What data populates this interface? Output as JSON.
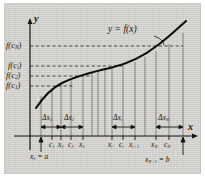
{
  "figure": {
    "type": "riemann-sum-diagram",
    "background_color": "#d2d0cc",
    "curve_color": "#101010",
    "grid_color": "#6b6b6b",
    "dash_color": "#3a3a3a"
  },
  "axes": {
    "y_label": "y",
    "x_label": "x",
    "origin": {
      "x": 30,
      "y": 136
    }
  },
  "curve_label": "y = f(x)",
  "y_values": [
    {
      "id": "fcN",
      "text_main": "f(c",
      "text_sub": "N",
      "text_end": ")",
      "y": 46
    },
    {
      "id": "fci",
      "text_main": "f(c",
      "text_sub": "i",
      "text_end": ")",
      "y": 66
    },
    {
      "id": "fc2",
      "text_main": "f(c",
      "text_sub": "2",
      "text_end": ")",
      "y": 76
    },
    {
      "id": "fc1",
      "text_main": "f(c",
      "text_sub": "1",
      "text_end": ")",
      "y": 86
    }
  ],
  "dashed_lines": [
    {
      "id": "fcN",
      "y": 46,
      "x_end": 183
    },
    {
      "id": "fci",
      "y": 66,
      "x_end": 125
    },
    {
      "id": "fc2",
      "y": 76,
      "x_end": 92
    },
    {
      "id": "fc1",
      "y": 86,
      "x_end": 74
    }
  ],
  "delta_labels": [
    {
      "id": "dx1",
      "text_main": "Δx",
      "text_sub": "1",
      "x": 50,
      "y": 118
    },
    {
      "id": "dx2",
      "text_main": "Δx",
      "text_sub": "2",
      "x": 77,
      "y": 118
    },
    {
      "id": "dxi",
      "text_main": "Δx",
      "text_sub": "i",
      "x": 119,
      "y": 118
    },
    {
      "id": "dxN",
      "text_main": "Δx",
      "text_sub": "N",
      "x": 163,
      "y": 118
    }
  ],
  "x_ticks": [
    {
      "id": "c1",
      "text_main": "c",
      "text_sub": "1",
      "x": 52
    },
    {
      "id": "x2",
      "text_main": "x",
      "text_sub": "2",
      "x": 62
    },
    {
      "id": "c2",
      "text_main": "c",
      "text_sub": "2",
      "x": 71
    },
    {
      "id": "x3",
      "text_main": "x",
      "text_sub": "3",
      "x": 83
    },
    {
      "id": "xi",
      "text_main": "x",
      "text_sub": "i",
      "x": 112
    },
    {
      "id": "ci",
      "text_main": "c",
      "text_sub": "i",
      "x": 123
    },
    {
      "id": "xi1",
      "text_main": "x",
      "text_sub": "i+1",
      "x": 135
    },
    {
      "id": "xN",
      "text_main": "x",
      "text_sub": "N",
      "x": 156
    },
    {
      "id": "cN",
      "text_main": "c",
      "text_sub": "N",
      "x": 169
    }
  ],
  "endpoints": [
    {
      "id": "a",
      "text_main": "x",
      "text_sub": "1",
      "text_end": " = a",
      "x": 36,
      "y": 157,
      "arrow_x": 41
    },
    {
      "id": "b",
      "text_main": "x",
      "text_sub": "N+1",
      "text_end": " = b",
      "x": 148,
      "y": 160,
      "arrow_x": 183
    }
  ],
  "partition_x": [
    41,
    61,
    83,
    105,
    112,
    135,
    156,
    183
  ],
  "sample_x": [
    52,
    71,
    123,
    169
  ]
}
